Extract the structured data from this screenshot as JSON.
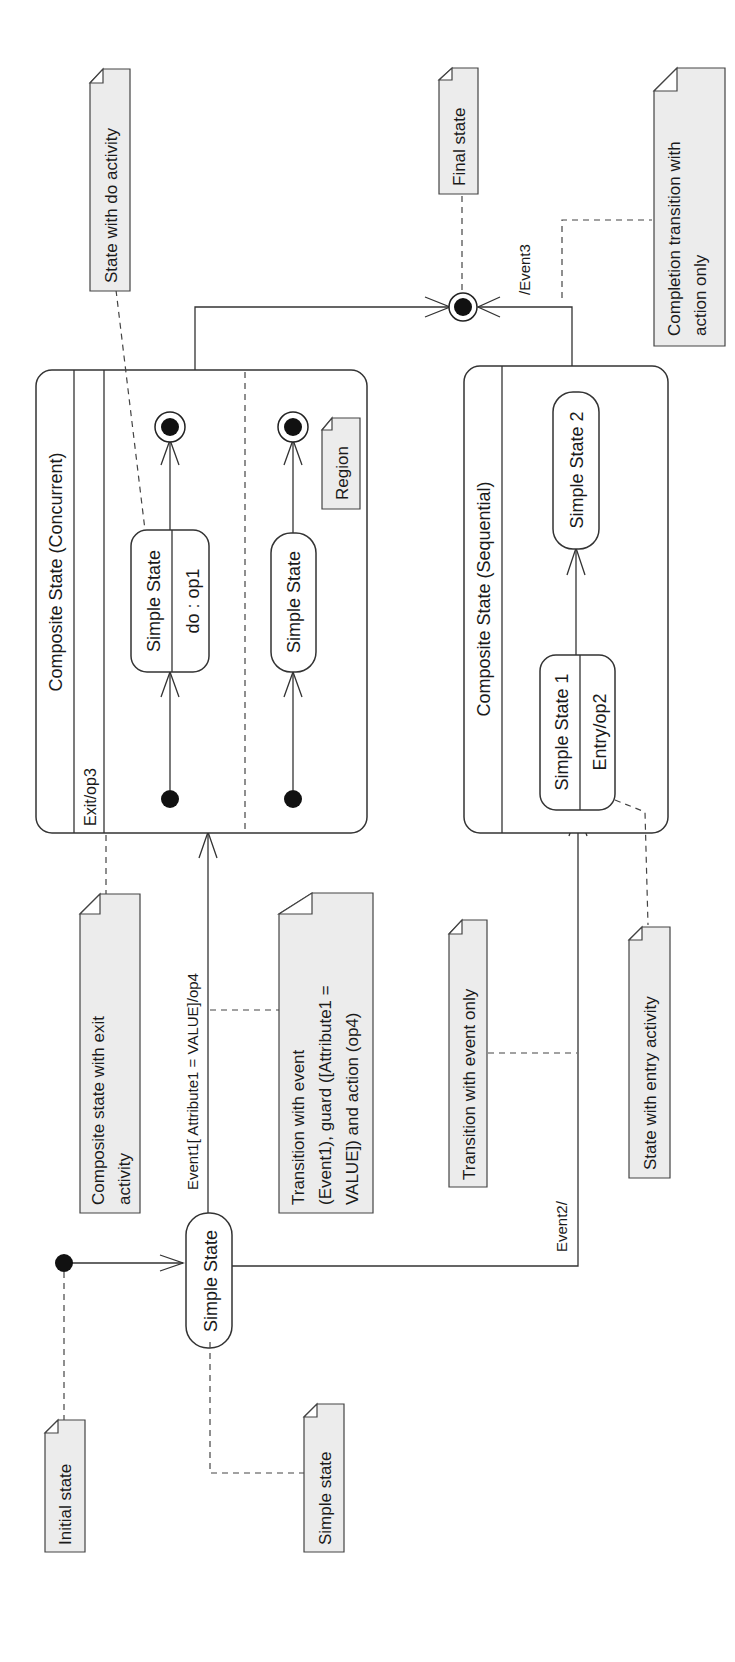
{
  "diagram": {
    "orientation": "rotated-ccw",
    "colors": {
      "line": "#333333",
      "note_fill": "#ececec",
      "background": "#ffffff",
      "dot": "#111111"
    },
    "states": {
      "simple_state_main": {
        "label": "Simple State"
      },
      "composite_concurrent": {
        "label": "Composite State (Concurrent)",
        "activity": "Exit/op3",
        "region1_state": {
          "label": "Simple State",
          "activity": "do : op1"
        },
        "region2_state": {
          "label": "Simple State"
        }
      },
      "composite_sequential": {
        "label": "Composite State (Sequential)",
        "state1": {
          "label": "Simple State 1",
          "activity": "Entry/op2"
        },
        "state2": {
          "label": "Simple State 2"
        }
      }
    },
    "transitions": {
      "event1": "Event1[ Attribute1 = VALUE]/op4",
      "event2": "Event2/",
      "event3": "/Event3"
    },
    "notes": {
      "initial_state": [
        "Initial state"
      ],
      "simple_state": [
        "Simple state"
      ],
      "composite_exit": [
        "Composite state with exit",
        "activity"
      ],
      "transition_full": [
        "Transition with event",
        "(Event1), guard ([Attribute1 =",
        "VALUE]) and action (op4)"
      ],
      "transition_event_only": [
        "Transition with event only"
      ],
      "state_entry": [
        "State with entry activity"
      ],
      "state_do": [
        "State with do activity"
      ],
      "region": [
        "Region"
      ],
      "final_state": [
        "Final state"
      ],
      "completion": [
        "Completion transition with",
        "action only"
      ]
    }
  }
}
